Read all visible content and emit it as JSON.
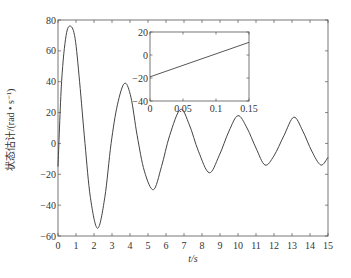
{
  "chart_data": [
    {
      "type": "line",
      "title": "",
      "xlabel": "t/s",
      "ylabel": "状态估计/(rad • s⁻¹)",
      "xlim": [
        0,
        15
      ],
      "ylim": [
        -60,
        80
      ],
      "xticks": [
        0,
        1,
        2,
        3,
        4,
        5,
        6,
        7,
        8,
        9,
        10,
        11,
        12,
        13,
        14,
        15
      ],
      "yticks": [
        -60,
        -40,
        -20,
        0,
        20,
        40,
        60,
        80
      ],
      "grid": false,
      "legend": null,
      "series": [
        {
          "name": "state estimate",
          "x": [
            0,
            0.2,
            0.45,
            0.7,
            0.95,
            1.2,
            1.5,
            1.8,
            2.2,
            2.6,
            2.95,
            3.3,
            3.7,
            4.05,
            4.4,
            4.8,
            5.3,
            5.75,
            6.2,
            6.8,
            7.3,
            7.8,
            8.4,
            8.95,
            9.5,
            10.0,
            10.5,
            11.0,
            11.5,
            12.0,
            12.55,
            13.1,
            13.6,
            14.1,
            14.6,
            15.0
          ],
          "y": [
            -15,
            40,
            70,
            76,
            68,
            40,
            0,
            -35,
            -55,
            -35,
            0,
            25,
            39,
            30,
            5,
            -18,
            -30,
            -15,
            5,
            22,
            12,
            -5,
            -19,
            -8,
            8,
            18,
            10,
            -3,
            -14,
            -8,
            5,
            17,
            8,
            -5,
            -14,
            -9
          ]
        }
      ]
    },
    {
      "type": "line",
      "title": "inset",
      "xlabel": "",
      "ylabel": "",
      "xlim": [
        0,
        0.15
      ],
      "ylim": [
        -40,
        20
      ],
      "xticks": [
        0,
        0.05,
        0.1,
        0.15
      ],
      "yticks": [
        -40,
        -20,
        0,
        20
      ],
      "series": [
        {
          "name": "state estimate (zoom)",
          "x": [
            0,
            0.15
          ],
          "y": [
            -19,
            11
          ]
        }
      ]
    }
  ],
  "labels": {
    "xlabel": "t/s",
    "ylabel": "状态估计/(rad • s⁻¹)"
  }
}
